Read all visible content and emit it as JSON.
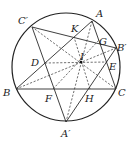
{
  "diagram": {
    "circle": {
      "cx": 66,
      "cy": 67,
      "r": 54
    },
    "points": {
      "A": {
        "label": "A",
        "x": 92,
        "y": 21,
        "lx": 96,
        "ly": 17
      },
      "B": {
        "label": "B",
        "x": 16,
        "y": 89,
        "lx": 3,
        "ly": 96
      },
      "C": {
        "label": "C",
        "x": 116,
        "y": 89,
        "lx": 118,
        "ly": 96
      },
      "A'": {
        "label": "A′",
        "x": 66,
        "y": 122,
        "lx": 61,
        "ly": 137
      },
      "B'": {
        "label": "B′",
        "x": 116,
        "y": 48,
        "lx": 117,
        "ly": 51
      },
      "C'": {
        "label": "C′",
        "x": 32,
        "y": 27,
        "lx": 18,
        "ly": 24
      },
      "I": {
        "label": "I",
        "x": 81,
        "y": 62,
        "lx": 80,
        "ly": 60
      },
      "D": {
        "label": "D",
        "x": 45,
        "y": 63,
        "lx": 31,
        "ly": 66
      },
      "E": {
        "label": "E",
        "x": 107,
        "y": 62,
        "lx": 109,
        "ly": 70
      },
      "F": {
        "label": "F",
        "x": 53,
        "y": 89,
        "lx": 45,
        "ly": 102
      },
      "G": {
        "label": "G",
        "x": 99,
        "y": 40,
        "lx": 99,
        "ly": 45
      },
      "H": {
        "label": "H",
        "x": 90,
        "y": 89,
        "lx": 85,
        "ly": 102
      },
      "K": {
        "label": "K",
        "x": 74,
        "y": 37,
        "lx": 71,
        "ly": 32
      }
    },
    "solid_segments": [
      [
        "A",
        "B"
      ],
      [
        "B",
        "C"
      ],
      [
        "C",
        "A"
      ],
      [
        "A'",
        "B'"
      ],
      [
        "B'",
        "C'"
      ],
      [
        "C'",
        "A'"
      ]
    ],
    "dashed_segments": [
      [
        "A",
        "A'"
      ],
      [
        "B",
        "B'"
      ],
      [
        "C",
        "C'"
      ],
      [
        "D",
        "E"
      ],
      [
        "F",
        "G"
      ],
      [
        "H",
        "K"
      ]
    ]
  }
}
